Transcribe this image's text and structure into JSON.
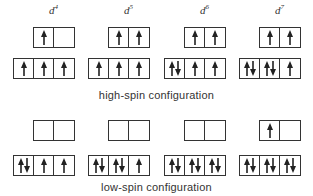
{
  "columns": [
    {
      "label_base": "d",
      "label_sup": "4",
      "x": 13,
      "high": {
        "eg": [
          "up",
          ""
        ],
        "t2g": [
          "up",
          "up",
          "up"
        ]
      },
      "low": {
        "eg": [
          "",
          ""
        ],
        "t2g": [
          "updown",
          "up",
          "up"
        ]
      }
    },
    {
      "label_base": "d",
      "label_sup": "5",
      "x": 88,
      "high": {
        "eg": [
          "up",
          "up"
        ],
        "t2g": [
          "up",
          "up",
          "up"
        ]
      },
      "low": {
        "eg": [
          "",
          ""
        ],
        "t2g": [
          "updown",
          "updown",
          "up"
        ]
      }
    },
    {
      "label_base": "d",
      "label_sup": "6",
      "x": 164,
      "high": {
        "eg": [
          "up",
          "up"
        ],
        "t2g": [
          "updown",
          "up",
          "up"
        ]
      },
      "low": {
        "eg": [
          "",
          ""
        ],
        "t2g": [
          "updown",
          "updown",
          "updown"
        ]
      }
    },
    {
      "label_base": "d",
      "label_sup": "7",
      "x": 239,
      "high": {
        "eg": [
          "up",
          "up"
        ],
        "t2g": [
          "updown",
          "updown",
          "up"
        ]
      },
      "low": {
        "eg": [
          "up",
          ""
        ],
        "t2g": [
          "updown",
          "updown",
          "updown"
        ]
      }
    }
  ],
  "captions": {
    "high": "high-spin configuration",
    "low": "low-spin configuration"
  }
}
